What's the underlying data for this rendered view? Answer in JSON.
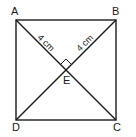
{
  "figure": {
    "type": "square with diagonals",
    "vertices": {
      "A": "A",
      "B": "B",
      "C": "C",
      "D": "D",
      "E": "E"
    },
    "measurements": {
      "AE": "4 cm",
      "BE": "4 cm"
    },
    "right_angle_at": "E"
  }
}
